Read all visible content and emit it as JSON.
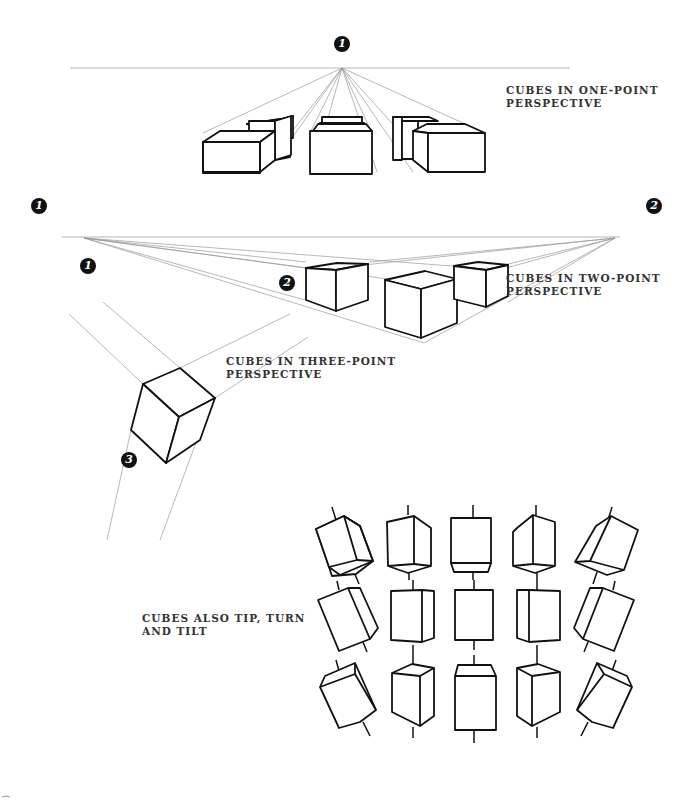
{
  "sections": {
    "one_point": {
      "label_line1": "CUBES IN ONE-POINT",
      "label_line2": "PERSPECTIVE",
      "vanishing_points": [
        "1"
      ]
    },
    "two_point": {
      "label_line1": "CUBES IN TWO-POINT",
      "label_line2": "PERSPECTIVE",
      "vanishing_points": [
        "1",
        "2"
      ]
    },
    "three_point": {
      "label_line1": "CUBES IN THREE-POINT",
      "label_line2": "PERSPECTIVE",
      "vanishing_points": [
        "1",
        "2",
        "3"
      ]
    },
    "tip_turn_tilt": {
      "label_line1": "CUBES ALSO TIP, TURN",
      "label_line2": "AND TILT",
      "grid": {
        "rows": 3,
        "columns": 5
      }
    }
  },
  "colors": {
    "ink": "#111111",
    "guide_lines": "#9a9a9a",
    "label_text": "#333333",
    "background": "#ffffff"
  }
}
